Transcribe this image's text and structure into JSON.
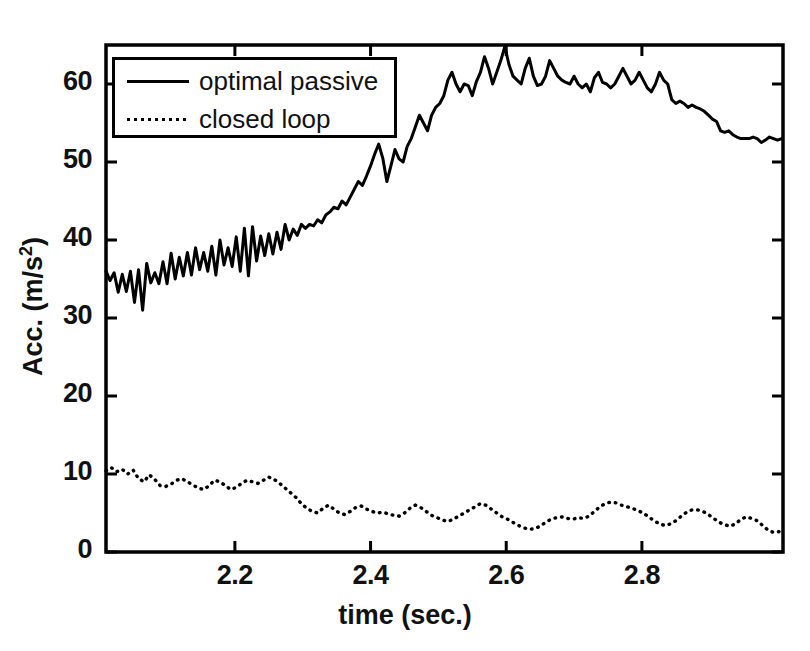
{
  "chart_data": {
    "type": "line",
    "title": "",
    "xlabel": "time (sec.)",
    "ylabel": "Acc. (m/s 2)",
    "ylabel_base": "Acc. (m/s",
    "ylabel_exp": "2",
    "ylabel_close": ")",
    "xlim": [
      2.01,
      3.008
    ],
    "ylim": [
      0,
      65
    ],
    "xticks": [
      2.2,
      2.4,
      2.6,
      2.8
    ],
    "xtick_labels": [
      "2.2",
      "2.4",
      "2.6",
      "2.8"
    ],
    "yticks": [
      0,
      10,
      20,
      30,
      40,
      50,
      60
    ],
    "ytick_labels": [
      "0",
      "10",
      "20",
      "30",
      "40",
      "50",
      "60"
    ],
    "grid": false,
    "legend_position": "upper-left-inside",
    "line_color": "#000000",
    "frame_color": "#000000",
    "series": [
      {
        "name": "optimal passive",
        "style": "solid",
        "x": [
          2.01,
          2.016,
          2.022,
          2.028,
          2.034,
          2.04,
          2.046,
          2.052,
          2.058,
          2.064,
          2.07,
          2.076,
          2.082,
          2.088,
          2.094,
          2.1,
          2.106,
          2.112,
          2.118,
          2.124,
          2.13,
          2.136,
          2.142,
          2.148,
          2.154,
          2.16,
          2.166,
          2.172,
          2.178,
          2.184,
          2.19,
          2.196,
          2.202,
          2.208,
          2.214,
          2.22,
          2.226,
          2.232,
          2.238,
          2.244,
          2.25,
          2.256,
          2.262,
          2.268,
          2.274,
          2.28,
          2.286,
          2.292,
          2.298,
          2.304,
          2.31,
          2.316,
          2.322,
          2.328,
          2.334,
          2.34,
          2.346,
          2.352,
          2.358,
          2.364,
          2.37,
          2.376,
          2.382,
          2.388,
          2.394,
          2.4,
          2.406,
          2.412,
          2.418,
          2.424,
          2.43,
          2.436,
          2.442,
          2.448,
          2.454,
          2.46,
          2.466,
          2.472,
          2.478,
          2.484,
          2.49,
          2.496,
          2.502,
          2.508,
          2.514,
          2.52,
          2.526,
          2.532,
          2.538,
          2.544,
          2.55,
          2.556,
          2.562,
          2.568,
          2.574,
          2.58,
          2.586,
          2.592,
          2.598,
          2.604,
          2.61,
          2.616,
          2.622,
          2.628,
          2.634,
          2.64,
          2.646,
          2.652,
          2.658,
          2.664,
          2.67,
          2.676,
          2.682,
          2.688,
          2.694,
          2.7,
          2.706,
          2.712,
          2.718,
          2.724,
          2.73,
          2.736,
          2.742,
          2.748,
          2.754,
          2.76,
          2.766,
          2.772,
          2.778,
          2.784,
          2.79,
          2.796,
          2.802,
          2.808,
          2.814,
          2.82,
          2.826,
          2.832,
          2.838,
          2.844,
          2.85,
          2.856,
          2.862,
          2.868,
          2.874,
          2.88,
          2.886,
          2.892,
          2.898,
          2.904,
          2.91,
          2.916,
          2.922,
          2.928,
          2.934,
          2.94,
          2.946,
          2.952,
          2.958,
          2.964,
          2.97,
          2.976,
          2.982,
          2.988,
          2.994,
          3.0,
          3.006
        ],
        "y": [
          36.0,
          34.8,
          35.8,
          33.3,
          35.6,
          33.4,
          36.0,
          32.0,
          36.2,
          31.0,
          37.0,
          34.5,
          35.8,
          34.4,
          37.2,
          34.4,
          38.3,
          35.0,
          37.8,
          35.4,
          38.4,
          35.5,
          39.0,
          36.2,
          38.4,
          36.0,
          39.2,
          35.5,
          40.0,
          36.8,
          39.0,
          36.6,
          40.4,
          36.0,
          41.5,
          35.4,
          41.7,
          37.3,
          40.5,
          38.0,
          40.8,
          38.2,
          41.0,
          38.8,
          42.0,
          40.0,
          41.4,
          40.6,
          42.0,
          41.5,
          42.0,
          41.8,
          42.6,
          42.2,
          43.2,
          43.6,
          44.2,
          44.0,
          45.0,
          44.5,
          45.5,
          46.5,
          47.5,
          47.0,
          48.2,
          49.5,
          51.0,
          52.3,
          50.5,
          47.5,
          49.5,
          51.6,
          50.4,
          50.0,
          52.0,
          53.0,
          54.5,
          56.0,
          55.0,
          54.0,
          56.0,
          57.0,
          57.5,
          58.5,
          60.5,
          61.5,
          60.0,
          59.0,
          60.0,
          59.8,
          58.5,
          60.3,
          61.5,
          63.5,
          62.0,
          60.0,
          61.5,
          63.0,
          65.0,
          62.5,
          61.0,
          60.5,
          60.0,
          62.0,
          63.3,
          61.0,
          59.8,
          60.0,
          61.0,
          63.0,
          62.0,
          61.0,
          60.5,
          60.2,
          60.0,
          61.0,
          60.0,
          59.5,
          60.0,
          59.0,
          60.8,
          61.5,
          60.2,
          60.0,
          59.5,
          60.0,
          61.0,
          62.0,
          61.0,
          60.0,
          60.5,
          61.5,
          60.5,
          59.5,
          59.0,
          60.0,
          61.5,
          60.5,
          60.0,
          58.0,
          57.5,
          57.8,
          57.5,
          57.0,
          57.3,
          57.0,
          56.8,
          56.5,
          56.0,
          55.5,
          55.2,
          54.0,
          53.8,
          54.0,
          53.5,
          53.2,
          53.0,
          53.0,
          53.0,
          53.2,
          53.0,
          52.5,
          52.8,
          53.2,
          53.0,
          52.8,
          53.0
        ]
      },
      {
        "name": "closed loop",
        "style": "dotted",
        "x": [
          2.01,
          2.018,
          2.026,
          2.034,
          2.042,
          2.05,
          2.058,
          2.066,
          2.074,
          2.082,
          2.09,
          2.098,
          2.106,
          2.114,
          2.122,
          2.13,
          2.138,
          2.146,
          2.154,
          2.162,
          2.17,
          2.178,
          2.186,
          2.194,
          2.202,
          2.21,
          2.218,
          2.226,
          2.234,
          2.242,
          2.25,
          2.258,
          2.266,
          2.274,
          2.282,
          2.29,
          2.298,
          2.306,
          2.314,
          2.322,
          2.33,
          2.338,
          2.346,
          2.354,
          2.362,
          2.37,
          2.378,
          2.386,
          2.394,
          2.402,
          2.41,
          2.418,
          2.426,
          2.434,
          2.442,
          2.45,
          2.458,
          2.466,
          2.474,
          2.482,
          2.49,
          2.498,
          2.506,
          2.514,
          2.522,
          2.53,
          2.538,
          2.546,
          2.554,
          2.562,
          2.57,
          2.578,
          2.586,
          2.594,
          2.602,
          2.61,
          2.618,
          2.626,
          2.634,
          2.642,
          2.65,
          2.658,
          2.666,
          2.674,
          2.682,
          2.69,
          2.698,
          2.706,
          2.714,
          2.722,
          2.73,
          2.738,
          2.746,
          2.754,
          2.762,
          2.77,
          2.778,
          2.786,
          2.794,
          2.802,
          2.81,
          2.818,
          2.826,
          2.834,
          2.842,
          2.85,
          2.858,
          2.866,
          2.874,
          2.882,
          2.89,
          2.898,
          2.906,
          2.914,
          2.922,
          2.93,
          2.938,
          2.946,
          2.954,
          2.962,
          2.97,
          2.978,
          2.986,
          2.994,
          3.002,
          3.006
        ],
        "y": [
          10.4,
          10.8,
          10.3,
          10.6,
          10.0,
          10.5,
          9.4,
          9.0,
          9.9,
          9.3,
          8.5,
          8.4,
          8.7,
          9.2,
          9.4,
          9.0,
          8.6,
          8.2,
          8.0,
          8.5,
          9.2,
          9.0,
          8.5,
          8.0,
          8.3,
          8.8,
          9.2,
          9.0,
          8.8,
          9.2,
          9.6,
          9.3,
          8.8,
          8.2,
          7.6,
          7.0,
          6.2,
          5.6,
          5.2,
          5.0,
          5.6,
          6.0,
          5.5,
          5.0,
          4.8,
          5.2,
          5.7,
          5.9,
          5.5,
          5.2,
          5.0,
          5.1,
          4.9,
          4.7,
          4.6,
          5.0,
          5.6,
          6.0,
          5.7,
          5.2,
          4.7,
          4.4,
          4.1,
          3.9,
          4.2,
          4.6,
          5.0,
          5.4,
          5.8,
          6.2,
          6.0,
          5.5,
          5.0,
          4.5,
          4.2,
          3.8,
          3.4,
          3.1,
          2.9,
          3.0,
          3.3,
          3.8,
          4.2,
          4.4,
          4.5,
          4.3,
          4.2,
          4.4,
          4.3,
          4.6,
          5.2,
          5.8,
          6.2,
          6.4,
          6.3,
          6.0,
          5.8,
          5.6,
          5.3,
          5.0,
          4.5,
          4.0,
          3.6,
          3.4,
          3.6,
          4.0,
          4.6,
          5.1,
          5.4,
          5.4,
          5.2,
          4.8,
          4.3,
          3.8,
          3.5,
          3.3,
          3.6,
          4.2,
          4.5,
          4.3,
          4.0,
          3.4,
          2.8,
          2.5,
          2.6,
          3.0
        ]
      }
    ]
  },
  "legend": {
    "items": [
      {
        "label": "optimal passive",
        "style": "solid"
      },
      {
        "label": "closed loop",
        "style": "dotted"
      }
    ]
  }
}
